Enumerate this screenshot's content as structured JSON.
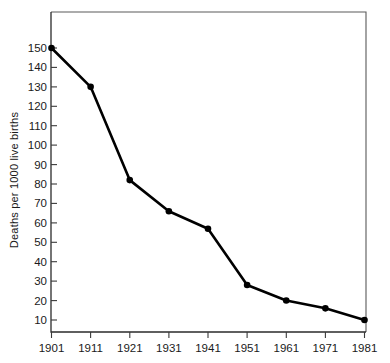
{
  "chart_data": {
    "type": "line",
    "title": "",
    "subtitle": "",
    "xlabel": "",
    "ylabel": "Deaths per 1000 live births",
    "x": [
      1901,
      1911,
      1921,
      1931,
      1941,
      1951,
      1961,
      1971,
      1981
    ],
    "categories": [
      "1901",
      "1911",
      "1921",
      "1931",
      "1941",
      "1951",
      "1961",
      "1971",
      "1981"
    ],
    "values": [
      150,
      130,
      82,
      66,
      57,
      28,
      20,
      16,
      10
    ],
    "series": [
      {
        "name": "Infant mortality rate",
        "values": [
          150,
          130,
          82,
          66,
          57,
          28,
          20,
          16,
          10
        ]
      }
    ],
    "xlim": [
      1901,
      1981
    ],
    "ylim": [
      0,
      160
    ],
    "yticks": [
      10,
      20,
      30,
      40,
      50,
      60,
      70,
      80,
      90,
      100,
      110,
      120,
      130,
      140,
      150
    ],
    "ytick_labels": [
      "10",
      "20",
      "30",
      "40",
      "50",
      "60",
      "70",
      "80",
      "90",
      "100",
      "110",
      "120",
      "130",
      "140",
      "150"
    ],
    "xticks": [
      1901,
      1911,
      1921,
      1931,
      1941,
      1951,
      1961,
      1971,
      1981
    ],
    "xtick_labels": [
      "1901",
      "1911",
      "1921",
      "1931",
      "1941",
      "1951",
      "1961",
      "1971",
      "1981"
    ],
    "grid": false,
    "legend": false,
    "legend_position": "none",
    "marker": "filled-circle",
    "line_color": "#000000",
    "marker_color": "#000000",
    "background_color": "#ffffff",
    "frame_color": "#5a5a5a"
  }
}
